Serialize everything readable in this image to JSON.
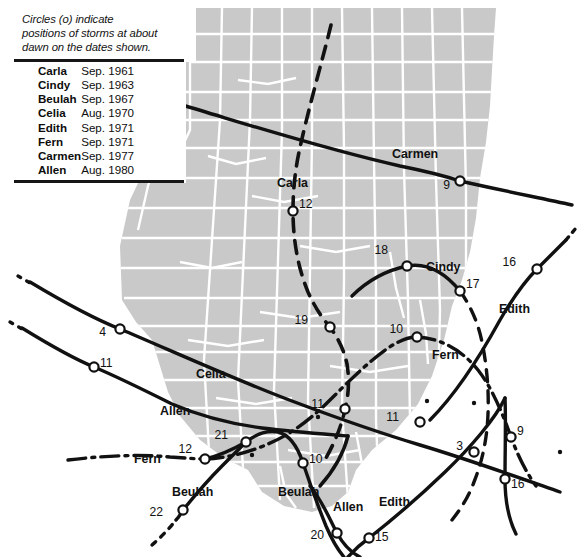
{
  "legend": {
    "note": "Circles (o) indicate positions of storms at about dawn on the dates shown.",
    "note_lines": [
      "Circles (o) indicate",
      "positions of storms at about",
      "dawn on the dates shown."
    ],
    "rows": [
      {
        "name": "Carla",
        "date": "Sep. 1961"
      },
      {
        "name": "Cindy",
        "date": "Sep. 1963"
      },
      {
        "name": "Beulah",
        "date": "Sep. 1967"
      },
      {
        "name": "Celia",
        "date": "Aug. 1970"
      },
      {
        "name": "Edith",
        "date": "Sep. 1971"
      },
      {
        "name": "Fern",
        "date": "Sep. 1971"
      },
      {
        "name": "Carmen",
        "date": "Sep. 1977"
      },
      {
        "name": "Allen",
        "date": "Aug. 1980"
      }
    ]
  },
  "map": {
    "land_color": "#c9c9c9",
    "county_line_color": "#ffffff",
    "track_color": "#111111",
    "background_color": "#ffffff"
  },
  "track_labels": [
    {
      "id": "carmen-label",
      "text": "Carmen",
      "x": 392,
      "y": 147
    },
    {
      "id": "carla-label",
      "text": "Carla",
      "x": 277,
      "y": 176
    },
    {
      "id": "cindy-label",
      "text": "Cindy",
      "x": 426,
      "y": 260
    },
    {
      "id": "edith-label-right",
      "text": "Edith",
      "x": 499,
      "y": 302
    },
    {
      "id": "celia-label",
      "text": "Celia",
      "x": 196,
      "y": 367
    },
    {
      "id": "fern-label-right",
      "text": "Fern",
      "x": 432,
      "y": 348
    },
    {
      "id": "allen-label-left",
      "text": "Allen",
      "x": 160,
      "y": 404
    },
    {
      "id": "fern-label-left",
      "text": "Fern",
      "x": 134,
      "y": 452
    },
    {
      "id": "beulah-label-left",
      "text": "Beulah",
      "x": 172,
      "y": 485
    },
    {
      "id": "beulah-label-right",
      "text": "Beulah",
      "x": 278,
      "y": 485
    },
    {
      "id": "allen-label-bottom",
      "text": "Allen",
      "x": 333,
      "y": 500
    },
    {
      "id": "edith-label-bottom",
      "text": "Edith",
      "x": 379,
      "y": 495
    }
  ],
  "storm_positions": [
    {
      "storm": "Carmen",
      "day": "9",
      "cx": 460,
      "cy": 181,
      "label_x": 450,
      "label_y": 185
    },
    {
      "storm": "Carla",
      "day": "12",
      "cx": 293,
      "cy": 211,
      "label_x": 299,
      "label_y": 204
    },
    {
      "storm": "Cindy",
      "day": "18",
      "cx": 407,
      "cy": 266,
      "label_x": 388,
      "label_y": 250
    },
    {
      "storm": "Cindy",
      "day": "17",
      "cx": 460,
      "cy": 291,
      "label_x": 466,
      "label_y": 284
    },
    {
      "storm": "Edith",
      "day": "16",
      "cx": 537,
      "cy": 269,
      "label_x": 516,
      "label_y": 262
    },
    {
      "storm": "Celia",
      "day": "4",
      "cx": 120,
      "cy": 329,
      "label_x": 106,
      "label_y": 332
    },
    {
      "storm": "Carla",
      "day": "19",
      "cx": 330,
      "cy": 327,
      "label_x": 308,
      "label_y": 320
    },
    {
      "storm": "Fern",
      "day": "10",
      "cx": 417,
      "cy": 337,
      "label_x": 403,
      "label_y": 329
    },
    {
      "storm": "Allen",
      "day": "11",
      "cx": 94,
      "cy": 367,
      "label_x": 100,
      "label_y": 363
    },
    {
      "storm": "Carla",
      "day": "11",
      "cx": 345,
      "cy": 409,
      "label_x": 324,
      "label_y": 404
    },
    {
      "storm": "Celia",
      "day": "11",
      "cx": 420,
      "cy": 422,
      "label_x": 399,
      "label_y": 417
    },
    {
      "storm": "Beulah",
      "day": "21",
      "cx": 246,
      "cy": 442,
      "label_x": 228,
      "label_y": 435
    },
    {
      "storm": "Fern",
      "day": "12",
      "cx": 205,
      "cy": 459,
      "label_x": 192,
      "label_y": 449
    },
    {
      "storm": "Beulah",
      "day": "10",
      "cx": 303,
      "cy": 463,
      "label_x": 309,
      "label_y": 459
    },
    {
      "storm": "Celia",
      "day": "3",
      "cx": 474,
      "cy": 452,
      "label_x": 463,
      "label_y": 446
    },
    {
      "storm": "Fern",
      "day": "9",
      "cx": 511,
      "cy": 437,
      "label_x": 517,
      "label_y": 431
    },
    {
      "storm": "Edith",
      "day": "16",
      "cx": 505,
      "cy": 479,
      "label_x": 511,
      "label_y": 484
    },
    {
      "storm": "Beulah",
      "day": "22",
      "cx": 183,
      "cy": 510,
      "label_x": 163,
      "label_y": 512
    },
    {
      "storm": "Allen",
      "day": "20",
      "cx": 337,
      "cy": 533,
      "label_x": 324,
      "label_y": 535
    },
    {
      "storm": "Edith",
      "day": "15",
      "cx": 369,
      "cy": 538,
      "label_x": 375,
      "label_y": 537
    }
  ]
}
